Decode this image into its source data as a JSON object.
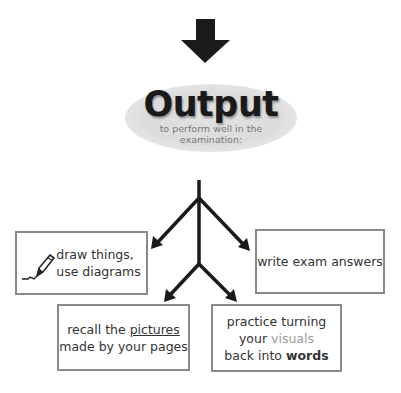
{
  "header": {
    "title": "Output",
    "subtitle_line1": "to perform well in the",
    "subtitle_line2": "examination:"
  },
  "boxes": [
    {
      "id": "draw",
      "icon": "pen-icon",
      "line1": "draw things,",
      "line2": "use diagrams"
    },
    {
      "id": "write",
      "line1": "write exam answers"
    },
    {
      "id": "recall",
      "line1_pre": "recall the ",
      "line1_underlined": "pictures",
      "line2": "made by your pages"
    },
    {
      "id": "practice",
      "line1": "practice turning",
      "line2_pre": "your ",
      "line2_highlight": "visuals",
      "line3_pre": "back into ",
      "line3_bold": "words"
    }
  ],
  "colors": {
    "arrow": "#1a1a1a",
    "box_border": "#8a8a8a",
    "text": "#333333",
    "subtitle": "#777777",
    "highlight": "#9a9a9a",
    "ellipse": "#dcdcdc"
  }
}
